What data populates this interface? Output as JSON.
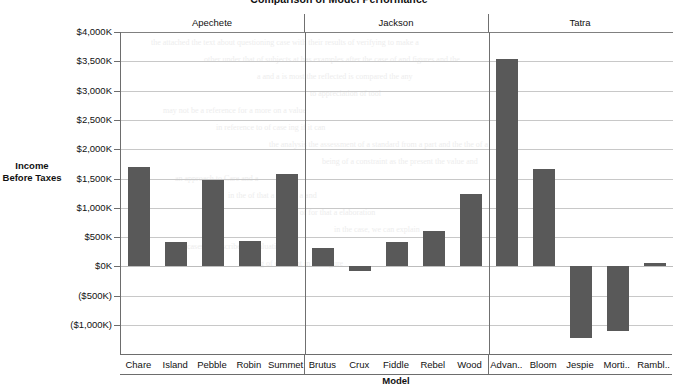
{
  "chart_data": {
    "type": "bar",
    "title": "Comparison of Model Performance",
    "xlabel": "Model",
    "ylabel": "Income Before Taxes",
    "ylim": [
      -1250,
      4000
    ],
    "yunit": "K",
    "grid": true,
    "legend": "none",
    "bar_color": "#595959",
    "ytick_labels": [
      "$4,000K",
      "$3,500K",
      "$3,000K",
      "$2,500K",
      "$2,000K",
      "$1,500K",
      "$1,000K",
      "$500K",
      "$0K",
      "($500K)",
      "($1,000K)"
    ],
    "ytick_values": [
      4000,
      3500,
      3000,
      2500,
      2000,
      1500,
      1000,
      500,
      0,
      -500,
      -1000
    ],
    "groups": [
      {
        "label": "Apechete",
        "categories": [
          "Chare",
          "Island",
          "Pebble",
          "Robin",
          "Summet"
        ],
        "values": [
          1700,
          420,
          1480,
          440,
          1580
        ]
      },
      {
        "label": "Jackson",
        "categories": [
          "Brutus",
          "Crux",
          "Fiddle",
          "Rebel",
          "Wood"
        ],
        "values": [
          310,
          -80,
          420,
          610,
          1240
        ]
      },
      {
        "label": "Tatra",
        "categories": [
          "Advan..",
          "Bloom",
          "Jespie",
          "Morti..",
          "Rambl.."
        ],
        "values": [
          3540,
          1660,
          -1230,
          -1100,
          50
        ]
      }
    ],
    "categories": [
      "Chare",
      "Island",
      "Pebble",
      "Robin",
      "Summet",
      "Brutus",
      "Crux",
      "Fiddle",
      "Rebel",
      "Wood",
      "Advan..",
      "Bloom",
      "Jespie",
      "Morti..",
      "Rambl.."
    ],
    "values": [
      1700,
      420,
      1480,
      440,
      1580,
      310,
      -80,
      420,
      610,
      1240,
      3540,
      1660,
      -1230,
      -1100,
      50
    ]
  },
  "ghost_text": [
    "the attached the text about questioning case with their results of verifying to make a",
    "other under that of subjects at has examples after the case of and figures and the",
    "a and a is most the reflected is compared the any",
    "to appreciation of tool",
    "may not be a reference for a more on a value",
    "in reference to of case ing if it can",
    "the analysis the assessment of a standard from a part and the the of a",
    "being of a constraint as the present the value and",
    "an approach to Care and a",
    "in the of that a should a and",
    "a sub of for that a elaboration",
    "in the case, we can explain",
    "cases to describe the valuation of",
    "reading of different in the figure"
  ]
}
